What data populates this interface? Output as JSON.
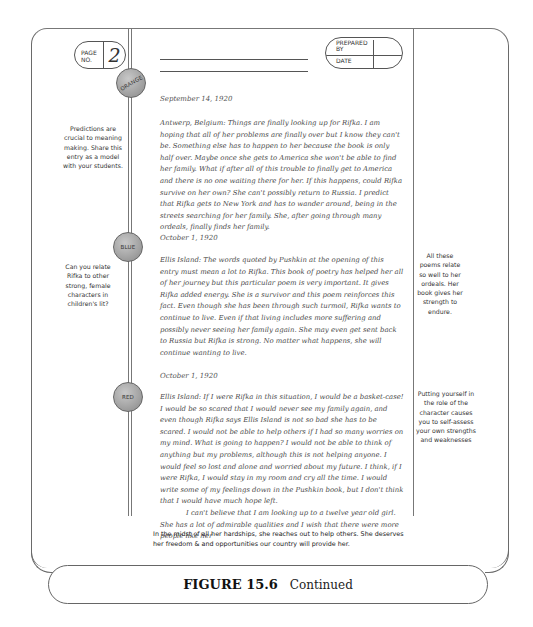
{
  "header": {
    "page_label": "PAGE NO.",
    "page_label_line1": "PAGE",
    "page_label_line2": "NO.",
    "page_number": "2",
    "prepared_by_label": "PREPARED BY",
    "prepared_by_line1": "PREPARED",
    "prepared_by_line2": "BY",
    "date_label": "DATE"
  },
  "entries": [
    {
      "badge": "ORANGE",
      "date": "September 14, 1920",
      "paragraphs": [
        "Antwerp, Belgium: Things are finally looking up for Rifka. I am hoping that all of her problems are finally over but I know they can't be. Something else has to happen to her because the book is only half over. Maybe once she gets to America she won't be able to find her family. What if after all of this trouble to finally get to America and there is no one waiting there for her. If this happens, could Rifka survive on her own? She can't possibly return to Russia. I predict that Rifka gets to New York and has to wander around, being in the streets searching for her family. She, after going through many ordeals, finally finds her family."
      ],
      "margin_note_left": "Predictions are crucial to meaning making. Share this entry as a model with your students."
    },
    {
      "badge": "BLUE",
      "date": "October 1, 1920",
      "paragraphs": [
        "Ellis Island: The words quoted by Pushkin at the opening of this entry must mean a lot to Rifka. This book of poetry has helped her all of her journey but this particular poem is very important. It gives Rifka added energy. She is a survivor and this poem reinforces this fact. Even though she has been through such turmoil, Rifka wants to continue to live. Even if that living includes more suffering and possibly never seeing her family again. She may even get sent back to Russia but Rifka is strong. No matter what happens, she will continue wanting to live."
      ],
      "margin_note_left": "Can you relate Rifka to other strong, female characters in children's lit?",
      "margin_note_right": "All these poems relate so well to her ordeals. Her book gives her strength to endure."
    },
    {
      "badge": "RED",
      "date": "October 1, 1920",
      "paragraphs": [
        "Ellis Island: If I were Rifka in this situation, I would be a basket-case! I would be so scared that I would never see my family again, and even though Rifka says Ellis Island is not so bad she has to be scared. I would not be able to help others if I had so many worries on my mind. What is going to happen? I would not be able to think of anything but my problems, although this is not helping anyone. I would feel so lost and alone and worried about my future. I think, if I were Rifka, I would stay in my room and cry all the time. I would write some of my feelings down in the Pushkin book, but I don't think that I would have much hope left.",
        "I can't believe that I am looking up to a twelve year old girl. She has a lot of admirable qualities and I wish that there were more people like her"
      ],
      "margin_note_right": "Putting yourself in the role of the character causes you to self-assess your own strengths and weaknesses"
    }
  ],
  "typed_comment": "In the midst of all her hardships, she reaches out to help others. She deserves her freedom & and opportunities our country will provide her.",
  "caption": {
    "figure": "FIGURE 15.6",
    "text": "Continued"
  }
}
